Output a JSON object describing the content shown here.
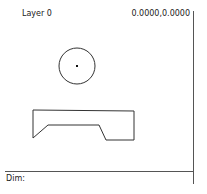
{
  "header": {
    "layer_label": "Layer 0",
    "coordinates": "0.0000,0.0000"
  },
  "footer": {
    "dim_label": "Dim:"
  },
  "drawing": {
    "stroke_color": "#333333",
    "circle": {
      "cx": 77,
      "cy": 66,
      "r": 18
    },
    "center_mark": {
      "x": 77,
      "y": 66
    },
    "polygon_points": "33,110 134,111 134,140 106,140 99,125 48,125 33,138"
  }
}
